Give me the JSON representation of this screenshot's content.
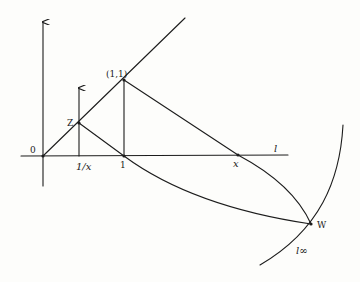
{
  "diagram": {
    "type": "geometric-construction",
    "colors": {
      "ink": "#1c1c1c",
      "paper": "#fdfdfb"
    },
    "labels": {
      "origin": "0",
      "z": "Z",
      "one_one": "(1,1)",
      "inv_x": "1/x",
      "one": "1",
      "x": "x",
      "line_l": "l",
      "w": "W",
      "l_infinity": "l∞"
    },
    "points": {
      "origin": [
        43,
        156
      ],
      "z": [
        79,
        123
      ],
      "one_one": [
        124,
        80
      ],
      "inv_x": [
        79,
        156
      ],
      "one": [
        124,
        156
      ],
      "x": [
        238,
        155
      ],
      "w": [
        311,
        224
      ]
    },
    "lines": [
      {
        "name": "vertical-axis",
        "from": [
          43,
          186
        ],
        "to": [
          43,
          22
        ],
        "arrow": true
      },
      {
        "name": "horizontal-axis-l",
        "from": [
          21,
          156
        ],
        "to": [
          288,
          155
        ]
      },
      {
        "name": "diagonal-y-equals-x",
        "from": [
          43,
          156
        ],
        "to": [
          185,
          18
        ]
      },
      {
        "name": "vertical-at-inv-x",
        "from": [
          79,
          156
        ],
        "to": [
          79,
          88
        ],
        "arrow": true
      },
      {
        "name": "vertical-at-one",
        "from": [
          124,
          156
        ],
        "to": [
          124,
          80
        ]
      },
      {
        "name": "z-to-one",
        "from": [
          79,
          123
        ],
        "to": [
          124,
          156
        ]
      },
      {
        "name": "one-one-to-x",
        "from": [
          124,
          80
        ],
        "to": [
          238,
          155
        ]
      }
    ],
    "curves": [
      {
        "name": "curve-one-to-w",
        "d": "M124,156 Q200,210 311,224"
      },
      {
        "name": "curve-x-to-w",
        "d": "M238,155 Q290,185 311,224"
      },
      {
        "name": "l-infinity-curve",
        "d": "M343,125 Q330,220 260,265"
      }
    ]
  }
}
